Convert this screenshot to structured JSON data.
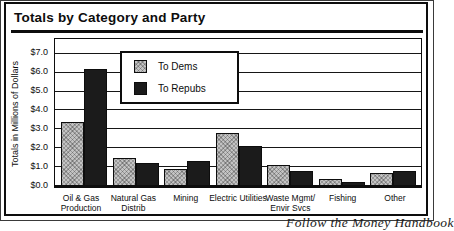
{
  "title": "Totals by Category and Party",
  "caption": "Follow the Money Handbook",
  "colors": {
    "dems_bar": "#c3c3c3",
    "repubs_bar": "#1b1b1b",
    "line": "#0d0d0d",
    "background": "#ffffff"
  },
  "legend": {
    "items": [
      {
        "label": "To Dems",
        "swatch": "gray-crosshatch"
      },
      {
        "label": "To Repubs",
        "swatch": "black-solid"
      }
    ]
  },
  "chart_data": {
    "type": "bar",
    "title": "Totals by Category and Party",
    "xlabel": "",
    "ylabel": "Totals in Millions of Dollars",
    "ylim": [
      0,
      7
    ],
    "grid": true,
    "legend_position": "inside-top-left",
    "yticks": [
      "$7.0",
      "$6.0",
      "$5.0",
      "$4.0",
      "$3.0",
      "$2.0",
      "$1.0",
      "$0.0"
    ],
    "categories": [
      "Oil & Gas Production",
      "Natural Gas Distrib",
      "Mining",
      "Electric Utilities",
      "Waste Mgmt/Envir Svcs",
      "Fishing",
      "Other"
    ],
    "categories_lines": [
      [
        "Oil & Gas",
        "Production"
      ],
      [
        "Natural Gas",
        "Distrib"
      ],
      [
        "Mining"
      ],
      [
        "Electric Utilities"
      ],
      [
        "Waste Mgmt/",
        "Envir Svcs"
      ],
      [
        "Fishing"
      ],
      [
        "Other"
      ]
    ],
    "series": [
      {
        "name": "To Dems",
        "color": "#c3c3c3",
        "pattern": "crosshatch",
        "values": [
          3.3,
          1.4,
          0.8,
          2.7,
          1.0,
          0.25,
          0.6
        ]
      },
      {
        "name": "To Repubs",
        "color": "#1b1b1b",
        "pattern": "solid",
        "values": [
          6.1,
          1.1,
          1.2,
          2.0,
          0.7,
          0.1,
          0.7
        ]
      }
    ]
  }
}
